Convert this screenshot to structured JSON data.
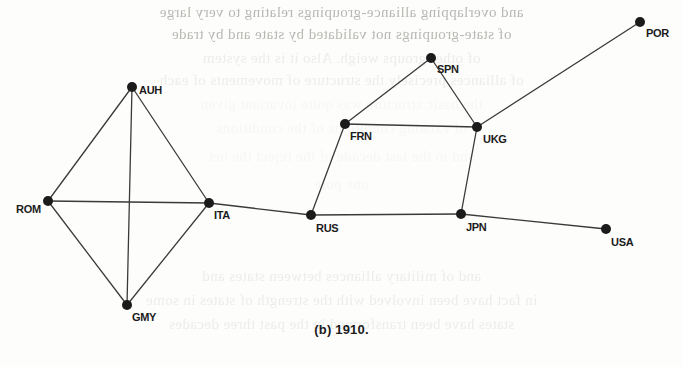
{
  "figure": {
    "caption": "(b) 1910.",
    "edge_color": "#3a3a3a",
    "node_color": "#1b1b1b",
    "background_color": "#fdfdfc"
  },
  "chart_data": {
    "type": "diagram",
    "subtype": "node-link-network-graph",
    "title": "(b) 1910.",
    "directed": false,
    "weighted": false,
    "layout": "fixed-2d-coordinates",
    "axis_ranges": {
      "x": [
        0,
        683
      ],
      "y": [
        0,
        367
      ]
    },
    "grid": false,
    "legend": null,
    "node_count": 11,
    "edge_count": 14,
    "nodes": [
      {
        "id": "AUH",
        "label": "AUH",
        "x": 132,
        "y": 87,
        "label_dx": 7,
        "label_dy": -2,
        "label_anchor": "left"
      },
      {
        "id": "ROM",
        "label": "ROM",
        "x": 48,
        "y": 201,
        "label_dx": -32,
        "label_dy": 3,
        "label_anchor": "left"
      },
      {
        "id": "ITA",
        "label": "ITA",
        "x": 209,
        "y": 203,
        "label_dx": 5,
        "label_dy": 7,
        "label_anchor": "left"
      },
      {
        "id": "GMY",
        "label": "GMY",
        "x": 127,
        "y": 305,
        "label_dx": 5,
        "label_dy": 7,
        "label_anchor": "left"
      },
      {
        "id": "RUS",
        "label": "RUS",
        "x": 311,
        "y": 215,
        "label_dx": 5,
        "label_dy": 8,
        "label_anchor": "left"
      },
      {
        "id": "FRN",
        "label": "FRN",
        "x": 345,
        "y": 124,
        "label_dx": 5,
        "label_dy": 7,
        "label_anchor": "left"
      },
      {
        "id": "SPN",
        "label": "SPN",
        "x": 431,
        "y": 58,
        "label_dx": 6,
        "label_dy": 6,
        "label_anchor": "left"
      },
      {
        "id": "UKG",
        "label": "UKG",
        "x": 477,
        "y": 127,
        "label_dx": 6,
        "label_dy": 7,
        "label_anchor": "left"
      },
      {
        "id": "JPN",
        "label": "JPN",
        "x": 461,
        "y": 214,
        "label_dx": 5,
        "label_dy": 8,
        "label_anchor": "left"
      },
      {
        "id": "POR",
        "label": "POR",
        "x": 640,
        "y": 22,
        "label_dx": 6,
        "label_dy": 6,
        "label_anchor": "left"
      },
      {
        "id": "USA",
        "label": "USA",
        "x": 606,
        "y": 229,
        "label_dx": 5,
        "label_dy": 8,
        "label_anchor": "left"
      }
    ],
    "edges": [
      {
        "source": "AUH",
        "target": "ROM"
      },
      {
        "source": "AUH",
        "target": "ITA"
      },
      {
        "source": "AUH",
        "target": "GMY"
      },
      {
        "source": "ROM",
        "target": "ITA"
      },
      {
        "source": "ROM",
        "target": "GMY"
      },
      {
        "source": "ITA",
        "target": "GMY"
      },
      {
        "source": "ITA",
        "target": "RUS"
      },
      {
        "source": "RUS",
        "target": "FRN"
      },
      {
        "source": "RUS",
        "target": "JPN"
      },
      {
        "source": "FRN",
        "target": "SPN"
      },
      {
        "source": "FRN",
        "target": "UKG"
      },
      {
        "source": "SPN",
        "target": "UKG"
      },
      {
        "source": "UKG",
        "target": "JPN"
      },
      {
        "source": "UKG",
        "target": "POR"
      },
      {
        "source": "JPN",
        "target": "USA"
      }
    ]
  },
  "bleed_through": {
    "note": "faint mirrored show-through text from the reverse side of the scanned page",
    "lines": [
      {
        "text": "and overlapping alliance-groupings relating to very large",
        "y": 4,
        "weight": "strong"
      },
      {
        "text": "of state-groupings not validated by state and by trade",
        "y": 26,
        "weight": "strong"
      },
      {
        "text": "of other groups weigh.  Also it is the system",
        "y": 50,
        "weight": "weak"
      },
      {
        "text": "of alliances precisely the structure of movements of each",
        "y": 72,
        "weight": "weak"
      },
      {
        "text": "the basic structure was quite invariant given",
        "y": 96,
        "weight": "faint"
      },
      {
        "text": "of existing conditions of the conditions",
        "y": 120,
        "weight": "faint"
      },
      {
        "text": "and in the last decade of the reject the net",
        "y": 148,
        "weight": "faint"
      },
      {
        "text": "one pole",
        "y": 176,
        "weight": "faint"
      },
      {
        "text": "and of military alliances between states and",
        "y": 268,
        "weight": "weak"
      },
      {
        "text": "in fact have been involved with the strength of states in some",
        "y": 292,
        "weight": "weak"
      },
      {
        "text": "states have been transformed in the past three decades",
        "y": 316,
        "weight": "weak"
      }
    ]
  }
}
